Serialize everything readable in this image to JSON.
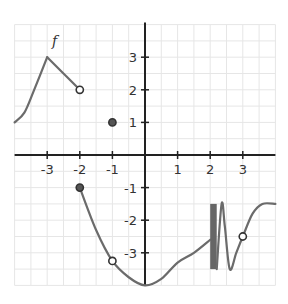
{
  "chart_data": {
    "type": "line",
    "title": "",
    "function_label": "f",
    "xlabel": "",
    "ylabel": "",
    "xlim": [
      -4,
      4
    ],
    "ylim": [
      -4,
      4
    ],
    "grid": true,
    "grid_step": 0.5,
    "x_ticks": [
      -3,
      -2,
      -1,
      1,
      2,
      3
    ],
    "y_ticks": [
      3,
      2,
      1,
      -1,
      -2,
      -3
    ],
    "x_tick_labels": [
      "-3",
      "-2",
      "-1",
      "1",
      "2",
      "3"
    ],
    "y_tick_labels": [
      "3",
      "2",
      "1",
      "-1",
      "-2",
      "-3"
    ],
    "segments": [
      {
        "name": "left-curve",
        "points": [
          [
            -4,
            1
          ],
          [
            -3.7,
            1.3
          ],
          [
            -3.4,
            2
          ],
          [
            -3,
            3
          ]
        ]
      },
      {
        "name": "line-to-open",
        "points": [
          [
            -3,
            3
          ],
          [
            -2,
            2
          ]
        ]
      },
      {
        "name": "middle-curve",
        "points": [
          [
            -2,
            -1
          ],
          [
            -1.5,
            -2.3
          ],
          [
            -1,
            -3.25
          ],
          [
            -0.5,
            -3.75
          ],
          [
            0,
            -4
          ],
          [
            0.5,
            -3.8
          ],
          [
            1,
            -3.3
          ],
          [
            1.5,
            -3
          ],
          [
            2,
            -2.6
          ]
        ]
      },
      {
        "name": "oscillation-band",
        "x_range": [
          2,
          2.2
        ],
        "y_range": [
          -1.5,
          -3.5
        ]
      },
      {
        "name": "right-wave",
        "points": [
          [
            2.2,
            -3.5
          ],
          [
            2.35,
            -1.5
          ],
          [
            2.45,
            -2.2
          ],
          [
            2.6,
            -3.5
          ],
          [
            2.8,
            -3
          ],
          [
            3,
            -2.5
          ],
          [
            3.3,
            -1.8
          ],
          [
            3.6,
            -1.5
          ],
          [
            4,
            -1.5
          ]
        ]
      }
    ],
    "points": [
      {
        "x": -2,
        "y": 2,
        "type": "open"
      },
      {
        "x": -1,
        "y": 1,
        "type": "closed"
      },
      {
        "x": -2,
        "y": -1,
        "type": "closed"
      },
      {
        "x": -1,
        "y": -3.25,
        "type": "open"
      },
      {
        "x": 3,
        "y": -2.5,
        "type": "open"
      }
    ],
    "colors": {
      "curve": "#6b6b6b",
      "axis": "#222222",
      "grid": "#e6e6e6",
      "band": "#666666"
    }
  }
}
